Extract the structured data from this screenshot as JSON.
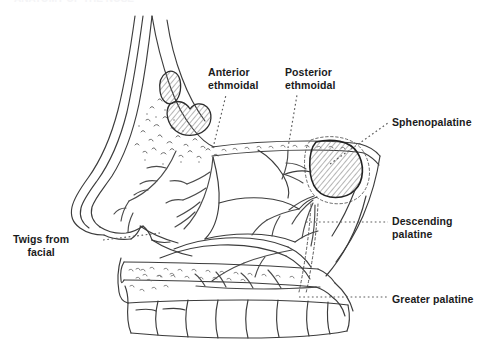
{
  "figure": {
    "type": "anatomical-illustration",
    "background_color": "#ffffff",
    "ink_color": "#3a3a3a",
    "text_color": "#1b1b1b",
    "width": 491,
    "height": 347,
    "cropped_header_text": "ANATOMY OF THE NOSE"
  },
  "labels": {
    "anterior_ethmoidal": "Anterior\nethmoidal",
    "posterior_ethmoidal": "Posterior\nethmoidal",
    "sphenopalatine": "Sphenopalatine",
    "descending_palatine": "Descending\npalatine",
    "greater_palatine": "Greater palatine",
    "twigs_from_facial": "Twigs from\nfacial"
  },
  "leader_lines": {
    "style": "dotted",
    "color": "#5a5a5a"
  },
  "structures": [
    {
      "name": "nasal-dorsum-skin-outline",
      "shading": "line"
    },
    {
      "name": "upper-lateral-cartilage",
      "shading": "hatched"
    },
    {
      "name": "lower-lateral-cartilage",
      "shading": "hatched"
    },
    {
      "name": "nasal-bone-stipple",
      "shading": "stipple"
    },
    {
      "name": "cribriform-plate-skull-base",
      "shading": "line"
    },
    {
      "name": "superior-turbinate",
      "shading": "line"
    },
    {
      "name": "middle-turbinate",
      "shading": "line"
    },
    {
      "name": "inferior-turbinate",
      "shading": "line"
    },
    {
      "name": "sphenoid-sinus",
      "shading": "hatched"
    },
    {
      "name": "hard-palate",
      "shading": "stipple"
    },
    {
      "name": "soft-palate",
      "shading": "line"
    },
    {
      "name": "upper-teeth-row",
      "shading": "line",
      "count": 8
    },
    {
      "name": "nasal-vestibule-columella",
      "shading": "line"
    }
  ]
}
